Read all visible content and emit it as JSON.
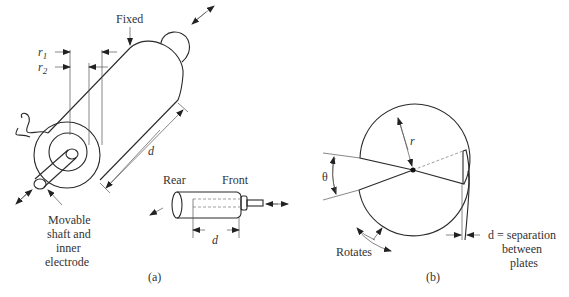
{
  "figure": {
    "panel_a": {
      "caption": "(a)",
      "labels": {
        "fixed": "Fixed",
        "r1": "r",
        "r1_sub": "1",
        "r2": "r",
        "r2_sub": "2",
        "d_main": "d",
        "movable_line1": "Movable",
        "movable_line2": "shaft and",
        "movable_line3": "inner",
        "movable_line4": "electrode",
        "rear": "Rear",
        "front": "Front",
        "d_small": "d"
      }
    },
    "panel_b": {
      "caption": "(b)",
      "labels": {
        "r": "r",
        "theta": "θ",
        "rotates": "Rotates",
        "sep_line1": "d = separation",
        "sep_line2": "between",
        "sep_line3": "plates"
      }
    }
  }
}
